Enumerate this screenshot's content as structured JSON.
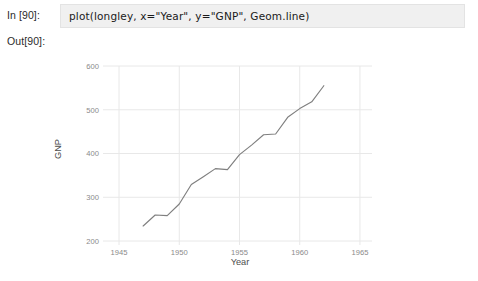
{
  "notebook": {
    "input_prompt": "In  [90]:",
    "output_prompt": "Out[90]:",
    "code": "plot(longley, x=\"Year\", y=\"GNP\", Geom.line)"
  },
  "colors": {
    "cell_background": "#f0f0f0",
    "cell_border": "#e3e3e3",
    "grid": "#e8e8e8",
    "line": "#7f7f7f",
    "tick_label": "#8a8a8a",
    "axis_title": "#4d4d4d",
    "page_background": "#ffffff"
  },
  "chart_data": {
    "type": "line",
    "title": "",
    "xlabel": "Year",
    "ylabel": "GNP",
    "xlim": [
      1944.0,
      1966.0
    ],
    "ylim": [
      200,
      600
    ],
    "xticks": [
      1945,
      1950,
      1955,
      1960,
      1965
    ],
    "yticks": [
      200,
      300,
      400,
      500,
      600
    ],
    "grid": true,
    "legend": false,
    "legend_position": "none",
    "series": [
      {
        "name": "GNP",
        "x": [
          1947,
          1948,
          1949,
          1950,
          1951,
          1952,
          1953,
          1954,
          1955,
          1956,
          1957,
          1958,
          1959,
          1960,
          1961,
          1962
        ],
        "values": [
          234.289,
          259.426,
          258.054,
          284.599,
          328.975,
          346.999,
          365.385,
          363.112,
          397.469,
          419.18,
          442.769,
          444.546,
          482.704,
          502.601,
          518.173,
          554.894
        ]
      }
    ]
  }
}
